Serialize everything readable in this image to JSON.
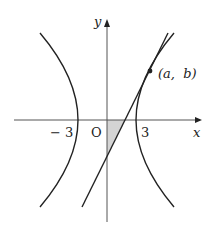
{
  "diagram": {
    "axes": {
      "x_label": "x",
      "y_label": "y",
      "origin_label": "O"
    },
    "ticks": {
      "neg_three": "− 3",
      "pos_three": "3"
    },
    "point": {
      "label": "(a,  b)"
    },
    "colors": {
      "stroke": "#222222",
      "axis": "#555555",
      "shade": "#d4d4d4"
    }
  }
}
